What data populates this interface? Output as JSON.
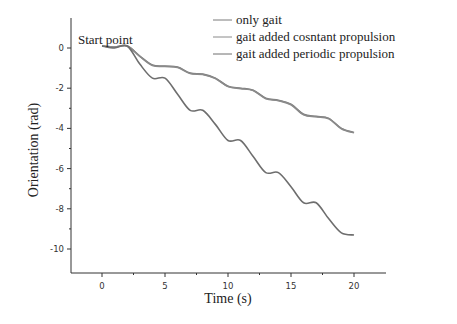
{
  "chart_data": {
    "type": "line",
    "title": "",
    "xlabel": "Time (s)",
    "ylabel": "Orientation (rad)",
    "xlim": [
      -2.5,
      22.5
    ],
    "ylim": [
      -11,
      1
    ],
    "x_ticks": [
      0,
      5,
      10,
      15,
      20
    ],
    "y_ticks": [
      0,
      -2,
      -4,
      -6,
      -8,
      -10
    ],
    "x_tick_labels": [
      "0",
      "5",
      "10",
      "15",
      "20"
    ],
    "y_tick_labels": [
      "0",
      "-2",
      "-4",
      "-6",
      "-8",
      "-10"
    ],
    "grid": false,
    "legend_position": "top-right",
    "annotations": [
      {
        "text": "Start point",
        "x": 0,
        "y": 0.1
      }
    ],
    "series": [
      {
        "name": "only gait",
        "color": "#7a7a7a",
        "x": [
          0,
          1,
          2,
          3,
          4,
          5,
          6,
          7,
          8,
          9,
          10,
          11,
          12,
          13,
          14,
          15,
          16,
          17,
          18,
          19,
          20
        ],
        "y": [
          0.1,
          0.05,
          0.1,
          -0.4,
          -0.85,
          -0.9,
          -0.95,
          -1.25,
          -1.3,
          -1.5,
          -1.9,
          -2.0,
          -2.1,
          -2.5,
          -2.6,
          -2.8,
          -3.3,
          -3.4,
          -3.5,
          -4.0,
          -4.2
        ]
      },
      {
        "name": "gait added cosntant propulsion",
        "color": "#8a8a8a",
        "x": [
          0,
          1,
          2,
          3,
          4,
          5,
          6,
          7,
          8,
          9,
          10,
          11,
          12,
          13,
          14,
          15,
          16,
          17,
          18,
          19,
          20
        ],
        "y": [
          0.1,
          0.05,
          0.1,
          -0.42,
          -0.87,
          -0.92,
          -0.97,
          -1.27,
          -1.32,
          -1.52,
          -1.92,
          -2.02,
          -2.12,
          -2.52,
          -2.62,
          -2.82,
          -3.32,
          -3.42,
          -3.52,
          -4.02,
          -4.22
        ]
      },
      {
        "name": "gait added periodic propulsion",
        "color": "#6e6e6e",
        "x": [
          0,
          1,
          2,
          3,
          4,
          5,
          6,
          7,
          8,
          9,
          10,
          11,
          12,
          13,
          14,
          15,
          16,
          17,
          18,
          19,
          20
        ],
        "y": [
          0.1,
          0.0,
          0.1,
          -0.8,
          -1.5,
          -1.5,
          -2.3,
          -3.1,
          -3.1,
          -3.8,
          -4.6,
          -4.6,
          -5.4,
          -6.2,
          -6.2,
          -6.9,
          -7.7,
          -7.7,
          -8.5,
          -9.2,
          -9.3
        ]
      }
    ]
  }
}
